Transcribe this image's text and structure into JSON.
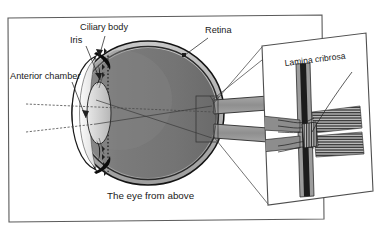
{
  "figure": {
    "caption": "The eye from above",
    "view_type": "horizontal section of the human eye, superior view",
    "background_color": "#ffffff",
    "frame_color": "#5a5a5a"
  },
  "labels": {
    "anterior_chamber": "Anterior chamber",
    "iris": "Iris",
    "ciliary_body": "Ciliary body",
    "retina": "Retina"
  },
  "inset": {
    "title": "Lamina cribrosa",
    "subject": "optic nerve head, nerve fibres passing through the scleral canal"
  },
  "anatomy": {
    "sclera_color": "#b4b4b4",
    "vitreous_color": "#787878",
    "cornea_color": "#ffffff",
    "lens_color": "#c9c9c9",
    "outline_color": "#151515",
    "nerve_color": "#9a9a9a",
    "ora_serrata_marker": "dotted vertical line",
    "parts": [
      "cornea",
      "anterior chamber",
      "iris",
      "lens",
      "ciliary body",
      "sclera",
      "choroid",
      "retina",
      "vitreous body",
      "optic nerve",
      "lamina cribrosa"
    ]
  },
  "axes": {
    "optic_axis": "dashed line through cornea and globe",
    "visual_axis": "dashed line angled toward the fovea"
  }
}
